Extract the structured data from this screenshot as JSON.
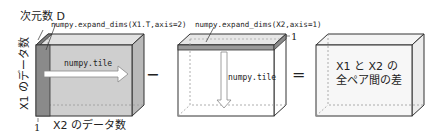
{
  "diagram": {
    "left_box": {
      "dim_label": "次元数 D",
      "expand_label": "numpy.expand_dims(X1.T,axis=2)",
      "tile_label": "numpy.tile",
      "vertical_axis_label": "X1 のデータ数",
      "horizontal_axis_label": "X2 のデータ数",
      "depth_one_label": "1"
    },
    "operator_minus": "−",
    "middle_box": {
      "expand_label": "numpy.expand_dims(X2,axis=1)",
      "depth_one_label": "1",
      "tile_label": "numpy.tile"
    },
    "operator_equals": "=",
    "right_box": {
      "result_line1": "X1 と X2 の",
      "result_line2": "全ペア間の差"
    },
    "colors": {
      "box_fill": "#cfcfcf",
      "box_side": "#b9b9b9",
      "box_top": "#dcdcdc",
      "slice_dark": "#8a8a8a",
      "outline": "#333333",
      "dashed": "#999999",
      "text": "#222222",
      "arrow_fill": "#ffffff"
    }
  }
}
